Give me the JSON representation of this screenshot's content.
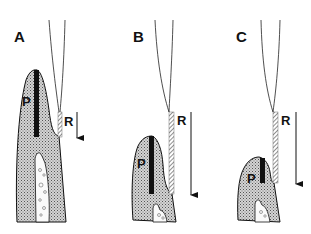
{
  "figure": {
    "panels": [
      {
        "id": "A",
        "label": "A",
        "p_label": "P",
        "r_label": "R"
      },
      {
        "id": "B",
        "label": "B",
        "p_label": "P",
        "r_label": "R"
      },
      {
        "id": "C",
        "label": "C",
        "p_label": "P",
        "r_label": "R"
      }
    ],
    "colors": {
      "ink": "#111111",
      "tissue_fill": "#bdbdbd",
      "background": "#ffffff"
    }
  }
}
